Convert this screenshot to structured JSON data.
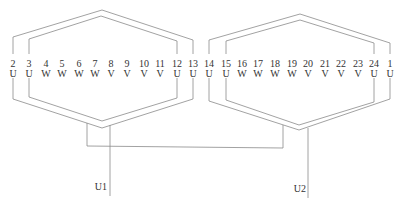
{
  "diagram": {
    "type": "connector-pinout",
    "line_color": "#8a8a8a",
    "text_color": "#333333",
    "connectors": [
      {
        "id": "left",
        "pins": [
          {
            "num": "2",
            "phase": "U"
          },
          {
            "num": "3",
            "phase": "U"
          },
          {
            "num": "4",
            "phase": "W"
          },
          {
            "num": "5",
            "phase": "W"
          },
          {
            "num": "6",
            "phase": "W"
          },
          {
            "num": "7",
            "phase": "W"
          },
          {
            "num": "8",
            "phase": "V"
          },
          {
            "num": "9",
            "phase": "V"
          },
          {
            "num": "10",
            "phase": "V"
          },
          {
            "num": "11",
            "phase": "V"
          },
          {
            "num": "12",
            "phase": "U"
          },
          {
            "num": "13",
            "phase": "U"
          }
        ]
      },
      {
        "id": "right",
        "pins": [
          {
            "num": "14",
            "phase": "U"
          },
          {
            "num": "15",
            "phase": "U"
          },
          {
            "num": "16",
            "phase": "W"
          },
          {
            "num": "17",
            "phase": "W"
          },
          {
            "num": "18",
            "phase": "W"
          },
          {
            "num": "19",
            "phase": "W"
          },
          {
            "num": "20",
            "phase": "V"
          },
          {
            "num": "21",
            "phase": "V"
          },
          {
            "num": "22",
            "phase": "V"
          },
          {
            "num": "23",
            "phase": "V"
          },
          {
            "num": "24",
            "phase": "U"
          },
          {
            "num": "1",
            "phase": "U"
          }
        ]
      }
    ],
    "leads": [
      {
        "label": "U1"
      },
      {
        "label": "U2"
      }
    ]
  }
}
